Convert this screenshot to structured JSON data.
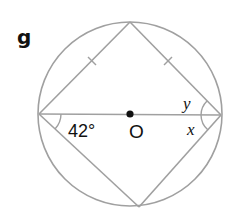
{
  "figure": {
    "part_label": "g",
    "angle_given": "42°",
    "center_label": "O",
    "unknown_upper": "y",
    "unknown_lower": "x"
  },
  "style": {
    "line_color": "#a0a0a0",
    "text_color": "#111111",
    "dot_color": "#111111",
    "background": "#ffffff"
  },
  "geometry": {
    "circle": {
      "cx": 130,
      "cy": 114,
      "r": 92
    },
    "vertices": {
      "top": [
        130,
        22
      ],
      "left": [
        39,
        114
      ],
      "right": [
        221,
        115
      ],
      "bottom": [
        139,
        207
      ]
    },
    "equal_side_ticks": 2
  }
}
